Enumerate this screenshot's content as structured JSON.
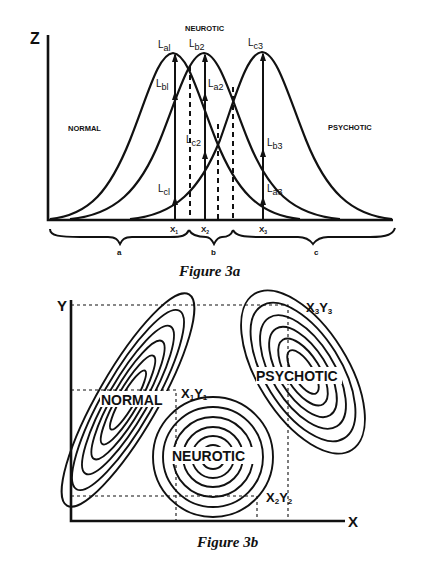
{
  "figure_3a": {
    "caption": "Figure 3a",
    "y_axis_label": "Z",
    "group_labels": {
      "normal": "NORMAL",
      "neurotic": "NEUROTIC",
      "psychotic": "PSYCHOTIC"
    },
    "likelihood_labels": {
      "La1": {
        "main": "L",
        "sub": "al"
      },
      "Lb1": {
        "main": "L",
        "sub": "bl"
      },
      "Lc1": {
        "main": "L",
        "sub": "cl"
      },
      "Lb2": {
        "main": "L",
        "sub": "b2"
      },
      "La2": {
        "main": "L",
        "sub": "a2"
      },
      "Lc2": {
        "main": "L",
        "sub": "c2"
      },
      "Lc3": {
        "main": "L",
        "sub": "c3"
      },
      "Lb3": {
        "main": "L",
        "sub": "b3"
      },
      "La3": {
        "main": "L",
        "sub": "a3"
      }
    },
    "x_points": [
      {
        "main": "X",
        "sub": "1"
      },
      {
        "main": "X",
        "sub": "2"
      },
      {
        "main": "X",
        "sub": "3"
      }
    ],
    "regions": [
      "a",
      "b",
      "c"
    ]
  },
  "figure_3b": {
    "caption": "Figure 3b",
    "x_axis_label": "X",
    "y_axis_label": "Y",
    "group_labels": {
      "normal": "NORMAL",
      "neurotic": "NEUROTIC",
      "psychotic": "PSYCHOTIC"
    },
    "points": [
      {
        "x": "X",
        "xs": "1",
        "y": "Y",
        "ys": "1"
      },
      {
        "x": "X",
        "xs": "2",
        "y": "Y",
        "ys": "2"
      },
      {
        "x": "X",
        "xs": "3",
        "y": "Y",
        "ys": "3"
      }
    ]
  }
}
